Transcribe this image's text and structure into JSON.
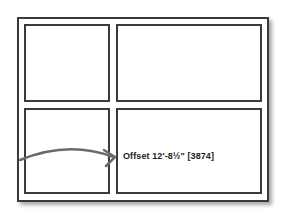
{
  "diagram": {
    "panels": [
      {
        "id": "top-left"
      },
      {
        "id": "top-right"
      },
      {
        "id": "bottom-left"
      },
      {
        "id": "bottom-right"
      }
    ],
    "annotation": {
      "label": "Offset 12'-8½\" [3874]",
      "arrow_color": "#6a6a6a"
    },
    "colors": {
      "frame": "#3a3a3a",
      "background": "#ffffff"
    }
  }
}
